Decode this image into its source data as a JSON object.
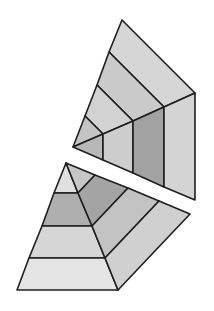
{
  "diagram": {
    "colors": {
      "stroke": "#1e1e1e",
      "lightest": "#e2e2e2",
      "light": "#d3d3d3",
      "mid": "#c2c2c2",
      "darker": "#b1b1b1",
      "dark": "#9c9c9c",
      "background": "#ffffff"
    },
    "upper_piece": {
      "faces": [
        {
          "name": "top-band-1",
          "points": "122,20 195,93 164,107 109,52",
          "fill": "#d6d6d6"
        },
        {
          "name": "top-band-2",
          "points": "109,52 164,107 133,121 97,85",
          "fill": "#cacaca"
        },
        {
          "name": "top-band-3",
          "points": "97,85 133,121 103,134 85,116",
          "fill": "#d2d2d2"
        },
        {
          "name": "top-band-4",
          "points": "85,116 103,134 73,147",
          "fill": "#c4c4c4"
        },
        {
          "name": "side-band-1",
          "points": "73,147 103,134 103,160",
          "fill": "#b8b8b8"
        },
        {
          "name": "side-band-2",
          "points": "103,134 133,121 133,173 103,160",
          "fill": "#cdcdcd"
        },
        {
          "name": "side-band-3",
          "points": "133,121 164,107 164,187 133,173",
          "fill": "#a2a2a2"
        },
        {
          "name": "side-band-4",
          "points": "164,107 195,93 195,200 164,187",
          "fill": "#d4d4d4"
        }
      ]
    },
    "lower_piece": {
      "faces": [
        {
          "name": "front-band-1",
          "points": "66,163 78,193 54,193",
          "fill": "#e0e0e0"
        },
        {
          "name": "front-band-2",
          "points": "54,193 78,193 92,226 42,226",
          "fill": "#aeaeae"
        },
        {
          "name": "front-band-3",
          "points": "42,226 92,226 105,258 29,258",
          "fill": "#d6d6d6"
        },
        {
          "name": "front-band-4",
          "points": "29,258 105,258 118,290 17,290",
          "fill": "#e4e4e4"
        },
        {
          "name": "side-band-1",
          "points": "66,163 95,175 78,193",
          "fill": "#c6c6c6"
        },
        {
          "name": "side-band-2",
          "points": "95,175 128,188 92,226 78,193",
          "fill": "#a4a4a4"
        },
        {
          "name": "side-band-3",
          "points": "128,188 159,201 105,258 92,226",
          "fill": "#c3c3c3"
        },
        {
          "name": "side-band-4",
          "points": "159,201 190,214 118,290 105,258",
          "fill": "#d0d0d0"
        }
      ]
    }
  }
}
